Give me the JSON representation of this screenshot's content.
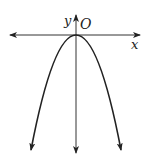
{
  "diagram": {
    "type": "coordinate-graph",
    "labels": {
      "x_axis": "x",
      "y_axis": "y",
      "origin": "O"
    },
    "colors": {
      "axis": "#333333",
      "curve": "#222222",
      "background": "#ffffff"
    },
    "curve": {
      "kind": "parabola",
      "opens": "down",
      "vertex": "origin"
    }
  }
}
